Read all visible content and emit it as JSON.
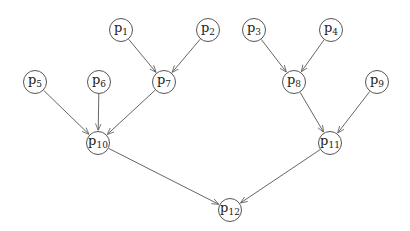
{
  "diagram": {
    "type": "directed-tree",
    "colors": {
      "edge": "#666666",
      "node_border": "#555555",
      "text": "#222222",
      "background": "#ffffff"
    },
    "nodes": [
      {
        "id": "p1",
        "base": "p",
        "sub": "1",
        "x": 121,
        "y": 30
      },
      {
        "id": "p2",
        "base": "p",
        "sub": "2",
        "x": 208,
        "y": 30
      },
      {
        "id": "p3",
        "base": "p",
        "sub": "3",
        "x": 254,
        "y": 30
      },
      {
        "id": "p4",
        "base": "p",
        "sub": "4",
        "x": 331,
        "y": 30
      },
      {
        "id": "p5",
        "base": "p",
        "sub": "5",
        "x": 35,
        "y": 82
      },
      {
        "id": "p6",
        "base": "p",
        "sub": "6",
        "x": 99,
        "y": 82
      },
      {
        "id": "p7",
        "base": "p",
        "sub": "7",
        "x": 164,
        "y": 82
      },
      {
        "id": "p8",
        "base": "p",
        "sub": "8",
        "x": 294,
        "y": 82
      },
      {
        "id": "p9",
        "base": "p",
        "sub": "9",
        "x": 377,
        "y": 82
      },
      {
        "id": "p10",
        "base": "p",
        "sub": "10",
        "x": 98,
        "y": 143
      },
      {
        "id": "p11",
        "base": "p",
        "sub": "11",
        "x": 330,
        "y": 143
      },
      {
        "id": "p12",
        "base": "p",
        "sub": "12",
        "x": 230,
        "y": 210
      }
    ],
    "edges": [
      {
        "from": "p1",
        "to": "p7"
      },
      {
        "from": "p2",
        "to": "p7"
      },
      {
        "from": "p3",
        "to": "p8"
      },
      {
        "from": "p4",
        "to": "p8"
      },
      {
        "from": "p5",
        "to": "p10"
      },
      {
        "from": "p6",
        "to": "p10"
      },
      {
        "from": "p7",
        "to": "p10"
      },
      {
        "from": "p8",
        "to": "p11"
      },
      {
        "from": "p9",
        "to": "p11"
      },
      {
        "from": "p10",
        "to": "p12"
      },
      {
        "from": "p11",
        "to": "p12"
      }
    ]
  }
}
